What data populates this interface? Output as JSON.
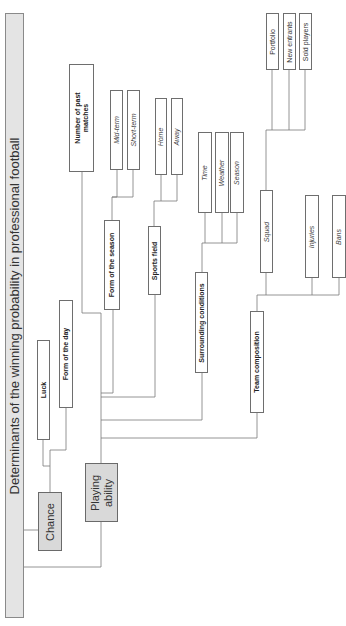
{
  "diagram": {
    "orientation": "rotated-90-ccw",
    "title": "Determinants of the winning probability in professional football",
    "root_children": [
      {
        "id": "chance",
        "label": "Chance",
        "style": "grey",
        "children": [
          {
            "id": "luck",
            "label": "Luck",
            "style": "bold"
          },
          {
            "id": "form_of_the_day",
            "label": "Form of the day",
            "style": "bold"
          }
        ]
      },
      {
        "id": "playing_ability",
        "label": "Playing ability",
        "label_lines": [
          "Playing",
          "ability"
        ],
        "style": "grey",
        "children": [
          {
            "id": "number_of_past_matches",
            "label": "Number of past matches",
            "label_lines": [
              "Number of past",
              "matches"
            ],
            "style": "bold"
          },
          {
            "id": "form_of_the_season",
            "label": "Form of the season",
            "style": "bold",
            "children": [
              {
                "id": "mid_term",
                "label": "Mid-term",
                "style": "italic"
              },
              {
                "id": "short_term",
                "label": "Short-term",
                "style": "italic"
              }
            ]
          },
          {
            "id": "sports_field",
            "label": "Sports field",
            "style": "bold",
            "children": [
              {
                "id": "home",
                "label": "Home",
                "style": "italic"
              },
              {
                "id": "away",
                "label": "Away",
                "style": "italic"
              }
            ]
          },
          {
            "id": "surrounding_conditions",
            "label": "Surrounding conditions",
            "style": "bold",
            "children": [
              {
                "id": "time",
                "label": "Time",
                "style": "italic"
              },
              {
                "id": "weather",
                "label": "Weather",
                "style": "italic"
              },
              {
                "id": "season",
                "label": "Season",
                "style": "italic"
              }
            ]
          },
          {
            "id": "team_composition",
            "label": "Team composition",
            "style": "bold",
            "children": [
              {
                "id": "squad",
                "label": "Squad",
                "style": "italic",
                "children": [
                  {
                    "id": "portfolio",
                    "label": "Portfolio",
                    "style": "plain"
                  },
                  {
                    "id": "new_entrants",
                    "label": "New entrants",
                    "style": "plain"
                  },
                  {
                    "id": "sold_players",
                    "label": "Sold players",
                    "style": "plain"
                  }
                ]
              },
              {
                "id": "injuries",
                "label": "Injuries",
                "style": "italic"
              },
              {
                "id": "bans",
                "label": "Bans",
                "style": "italic"
              }
            ]
          }
        ]
      }
    ]
  },
  "labels": {
    "title": "Determinants of the winning probability in professional football",
    "chance": "Chance",
    "playing_ability_l1": "Playing",
    "playing_ability_l2": "ability",
    "luck": "Luck",
    "form_of_the_day": "Form of the day",
    "number_of_past_matches_l1": "Number of past",
    "number_of_past_matches_l2": "matches",
    "form_of_the_season": "Form of the season",
    "mid_term": "Mid-term",
    "short_term": "Short-term",
    "sports_field": "Sports field",
    "home": "Home",
    "away": "Away",
    "surrounding_conditions": "Surrounding conditions",
    "time": "Time",
    "weather": "Weather",
    "season": "Season",
    "team_composition": "Team composition",
    "squad": "Squad",
    "portfolio": "Portfolio",
    "new_entrants": "New entrants",
    "sold_players": "Sold players",
    "injuries": "Injuries",
    "bans": "Bans"
  },
  "colors": {
    "line": "#7a7a7a",
    "box_border": "#6e6e6e",
    "grey_fill": "#d9d9d9",
    "title_fill": "#e4e4e4",
    "text": "#222222"
  }
}
